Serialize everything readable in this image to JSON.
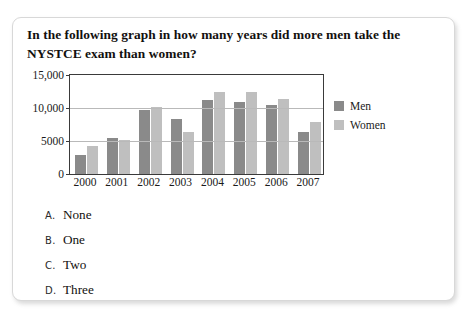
{
  "page": {
    "background": "#ffffff",
    "card_border": "#d8d8d8"
  },
  "question": {
    "text": "In the following graph in how many years did more men take the NYSTCE exam than women?"
  },
  "legend": {
    "items": [
      {
        "label": "Men",
        "color": "#8a8a8a"
      },
      {
        "label": "Women",
        "color": "#bfbfbf"
      }
    ]
  },
  "options": [
    {
      "letter": "A.",
      "label": "None"
    },
    {
      "letter": "B.",
      "label": "One"
    },
    {
      "letter": "C.",
      "label": "Two"
    },
    {
      "letter": "D.",
      "label": "Three"
    }
  ],
  "chart_data": {
    "type": "bar",
    "title": "",
    "xlabel": "",
    "ylabel": "",
    "categories": [
      "2000",
      "2001",
      "2002",
      "2003",
      "2004",
      "2005",
      "2006",
      "2007"
    ],
    "series": [
      {
        "name": "Men",
        "color": "#8a8a8a",
        "values": [
          2900,
          5500,
          9700,
          8300,
          11200,
          10900,
          10400,
          6400
        ]
      },
      {
        "name": "Women",
        "color": "#bfbfbf",
        "values": [
          4300,
          5200,
          10100,
          6400,
          12500,
          12400,
          11300,
          7900
        ]
      }
    ],
    "ylim": [
      0,
      15000
    ],
    "yticks": [
      0,
      5000,
      10000,
      15000
    ],
    "ytick_labels": [
      "0",
      "5000",
      "10,000",
      "15,000"
    ],
    "grid": true,
    "legend_position": "right"
  }
}
